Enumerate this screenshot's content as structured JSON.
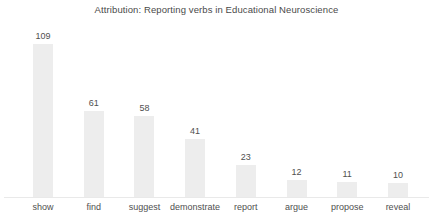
{
  "chart_data": {
    "type": "bar",
    "title": "Attribution: Reporting verbs in Educational Neuroscience",
    "xlabel": "",
    "ylabel": "",
    "ylim": [
      0,
      109
    ],
    "grid": false,
    "legend": null,
    "categories": [
      "show",
      "find",
      "suggest",
      "demonstrate",
      "report",
      "argue",
      "propose",
      "reveal"
    ],
    "values": [
      109,
      61,
      58,
      41,
      23,
      12,
      11,
      10
    ],
    "value_labels": [
      "109",
      "61",
      "58",
      "41",
      "23",
      "12",
      "11",
      "10"
    ],
    "bar_color": "#ededed",
    "text_color": "#4f4f4f",
    "axis_color": "#e9e9e9"
  }
}
